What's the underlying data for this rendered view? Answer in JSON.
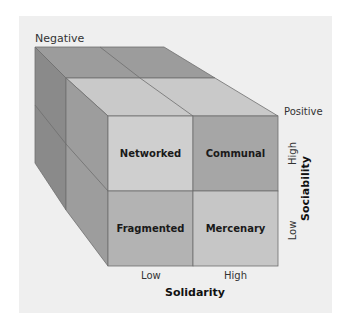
{
  "diagram": {
    "type": "3d-cube-matrix",
    "depth_axis": {
      "back_label": "Negative",
      "front_label": "Positive"
    },
    "x_axis": {
      "title": "Solidarity",
      "ticks": [
        "Low",
        "High"
      ]
    },
    "y_axis": {
      "title": "Sociability",
      "ticks": [
        "High",
        "Low"
      ]
    },
    "cells": [
      {
        "label": "Networked",
        "sociability": "High",
        "solidarity": "Low",
        "color": "#cfcfcf"
      },
      {
        "label": "Communal",
        "sociability": "High",
        "solidarity": "High",
        "color": "#a6a6a6"
      },
      {
        "label": "Fragmented",
        "sociability": "Low",
        "solidarity": "Low",
        "color": "#b3b3b3"
      },
      {
        "label": "Mercenary",
        "sociability": "Low",
        "solidarity": "High",
        "color": "#c6c6c6"
      }
    ],
    "colors": {
      "panel": "#efefef",
      "back_top": "#9c9c9c",
      "front_top": "#c9c9c9",
      "back_side": "#8a8a8a",
      "front_side": "#9d9d9d",
      "edge": "#6e6e6e"
    }
  }
}
